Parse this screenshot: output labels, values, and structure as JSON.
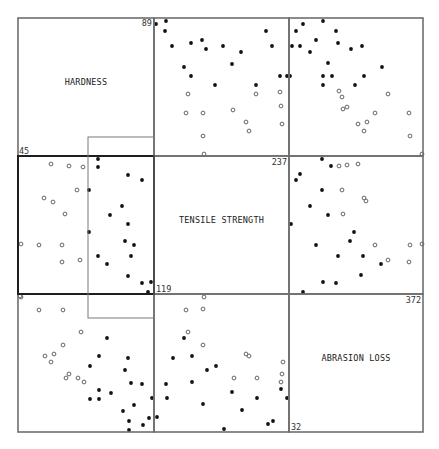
{
  "chart_data": {
    "type": "scatter",
    "subtype": "scatterplot-matrix",
    "title": "",
    "variables": [
      {
        "name": "HARDNESS",
        "min": 45,
        "max": 89
      },
      {
        "name": "TENSILE STRENGTH",
        "min": 119,
        "max": 237
      },
      {
        "name": "ABRASION LOSS",
        "min": 32,
        "max": 372
      }
    ],
    "diagonal_labels": [
      "HARDNESS",
      "TENSILE STRENGTH",
      "ABRASION LOSS"
    ],
    "range_labels": {
      "hardness_max": "89",
      "hardness_min": "45",
      "tensile_max": "237",
      "tensile_min": "119",
      "abrasion_max": "372",
      "abrasion_min": "32"
    },
    "legend": {
      "filled": "points inside brush (tensile strength in brushed range)",
      "open": "points outside brush"
    },
    "brush": {
      "panel": "row2-col1",
      "note": "rectangle brush spanning the right half of the TENSILE STRENGTH vs HARDNESS panel"
    },
    "selected_panel": "row2-col1",
    "grid": {
      "rows": 3,
      "cols": 3
    },
    "panels": [
      {
        "id": "r1c2",
        "row": 1,
        "col": 2,
        "x_var": "TENSILE STRENGTH",
        "y_var": "HARDNESS",
        "filled": [
          [
            2,
            6
          ],
          [
            12,
            3
          ],
          [
            11,
            13
          ],
          [
            18,
            28
          ],
          [
            37,
            25
          ],
          [
            48,
            22
          ],
          [
            52,
            31
          ],
          [
            69,
            28
          ],
          [
            87,
            34
          ],
          [
            112,
            13
          ],
          [
            118,
            28
          ],
          [
            30,
            49
          ],
          [
            37,
            58
          ],
          [
            78,
            46
          ],
          [
            61,
            67
          ],
          [
            102,
            67
          ],
          [
            126,
            58
          ],
          [
            133,
            58
          ]
        ],
        "open": [
          [
            34,
            76
          ],
          [
            32,
            95
          ],
          [
            49,
            95
          ],
          [
            79,
            92
          ],
          [
            102,
            76
          ],
          [
            126,
            74
          ],
          [
            127,
            88
          ],
          [
            128,
            106
          ],
          [
            92,
            104
          ],
          [
            95,
            113
          ],
          [
            49,
            118
          ],
          [
            50,
            136
          ]
        ]
      },
      {
        "id": "r1c3",
        "row": 1,
        "col": 3,
        "x_var": "ABRASION LOSS",
        "y_var": "HARDNESS",
        "filled": [
          [
            7,
            13
          ],
          [
            14,
            6
          ],
          [
            34,
            3
          ],
          [
            3,
            28
          ],
          [
            11,
            28
          ],
          [
            27,
            22
          ],
          [
            47,
            13
          ],
          [
            49,
            25
          ],
          [
            21,
            34
          ],
          [
            62,
            31
          ],
          [
            73,
            28
          ],
          [
            39,
            45
          ],
          [
            34,
            58
          ],
          [
            43,
            58
          ],
          [
            34,
            67
          ],
          [
            75,
            58
          ],
          [
            66,
            67
          ],
          [
            93,
            49
          ],
          [
            1,
            58
          ]
        ],
        "open": [
          [
            50,
            73
          ],
          [
            53,
            79
          ],
          [
            54,
            91
          ],
          [
            58,
            89
          ],
          [
            69,
            106
          ],
          [
            78,
            104
          ],
          [
            75,
            113
          ],
          [
            86,
            95
          ],
          [
            99,
            76
          ],
          [
            120,
            95
          ],
          [
            121,
            118
          ],
          [
            133,
            136
          ]
        ]
      },
      {
        "id": "r2c1",
        "row": 2,
        "col": 1,
        "x_var": "HARDNESS",
        "y_var": "TENSILE STRENGTH",
        "filled": [
          [
            80,
            3
          ],
          [
            80,
            11
          ],
          [
            110,
            19
          ],
          [
            124,
            24
          ],
          [
            71,
            34
          ],
          [
            104,
            50
          ],
          [
            92,
            59
          ],
          [
            110,
            68
          ],
          [
            71,
            76
          ],
          [
            107,
            85
          ],
          [
            116,
            89
          ],
          [
            80,
            100
          ],
          [
            113,
            100
          ],
          [
            89,
            108
          ],
          [
            110,
            120
          ],
          [
            124,
            127
          ],
          [
            133,
            126
          ],
          [
            130,
            136
          ]
        ],
        "open": [
          [
            33,
            8
          ],
          [
            51,
            10
          ],
          [
            65,
            11
          ],
          [
            59,
            34
          ],
          [
            26,
            42
          ],
          [
            35,
            46
          ],
          [
            47,
            58
          ],
          [
            3,
            88
          ],
          [
            21,
            89
          ],
          [
            44,
            89
          ],
          [
            44,
            106
          ],
          [
            62,
            104
          ],
          [
            3,
            141
          ]
        ]
      },
      {
        "id": "r2c3",
        "row": 2,
        "col": 3,
        "x_var": "ABRASION LOSS",
        "y_var": "TENSILE STRENGTH",
        "filled": [
          [
            33,
            3
          ],
          [
            42,
            10
          ],
          [
            11,
            18
          ],
          [
            7,
            24
          ],
          [
            33,
            34
          ],
          [
            21,
            50
          ],
          [
            39,
            59
          ],
          [
            2,
            68
          ],
          [
            65,
            76
          ],
          [
            61,
            85
          ],
          [
            27,
            89
          ],
          [
            49,
            100
          ],
          [
            74,
            100
          ],
          [
            92,
            108
          ],
          [
            72,
            119
          ],
          [
            34,
            126
          ],
          [
            47,
            127
          ],
          [
            14,
            136
          ]
        ],
        "open": [
          [
            50,
            10
          ],
          [
            58,
            9
          ],
          [
            69,
            8
          ],
          [
            53,
            34
          ],
          [
            75,
            42
          ],
          [
            77,
            45
          ],
          [
            54,
            58
          ],
          [
            86,
            89
          ],
          [
            121,
            89
          ],
          [
            133,
            88
          ],
          [
            99,
            104
          ],
          [
            120,
            106
          ]
        ]
      },
      {
        "id": "r3c1",
        "row": 3,
        "col": 1,
        "x_var": "HARDNESS",
        "y_var": "ABRASION LOSS",
        "filled": [
          [
            89,
            44
          ],
          [
            81,
            62
          ],
          [
            110,
            64
          ],
          [
            72,
            72
          ],
          [
            107,
            76
          ],
          [
            113,
            89
          ],
          [
            124,
            90
          ],
          [
            81,
            96
          ],
          [
            93,
            99
          ],
          [
            72,
            105
          ],
          [
            81,
            105
          ],
          [
            134,
            104
          ],
          [
            116,
            111
          ],
          [
            105,
            117
          ],
          [
            131,
            124
          ],
          [
            111,
            127
          ],
          [
            125,
            131
          ],
          [
            111,
            136
          ]
        ],
        "open": [
          [
            2,
            2
          ],
          [
            21,
            16
          ],
          [
            45,
            16
          ],
          [
            63,
            38
          ],
          [
            45,
            51
          ],
          [
            27,
            62
          ],
          [
            36,
            60
          ],
          [
            33,
            68
          ],
          [
            51,
            80
          ],
          [
            48,
            84
          ],
          [
            60,
            84
          ],
          [
            66,
            88
          ]
        ]
      },
      {
        "id": "r3c2",
        "row": 3,
        "col": 2,
        "x_var": "TENSILE STRENGTH",
        "y_var": "ABRASION LOSS",
        "filled": [
          [
            30,
            44
          ],
          [
            19,
            64
          ],
          [
            38,
            62
          ],
          [
            62,
            72
          ],
          [
            53,
            76
          ],
          [
            12,
            90
          ],
          [
            38,
            88
          ],
          [
            13,
            104
          ],
          [
            78,
            98
          ],
          [
            127,
            95
          ],
          [
            103,
            104
          ],
          [
            133,
            104
          ],
          [
            49,
            110
          ],
          [
            88,
            116
          ],
          [
            3,
            123
          ],
          [
            114,
            130
          ],
          [
            119,
            127
          ],
          [
            70,
            135
          ]
        ],
        "open": [
          [
            50,
            3
          ],
          [
            32,
            16
          ],
          [
            49,
            15
          ],
          [
            34,
            38
          ],
          [
            49,
            51
          ],
          [
            92,
            60
          ],
          [
            95,
            62
          ],
          [
            129,
            68
          ],
          [
            128,
            80
          ],
          [
            127,
            88
          ],
          [
            80,
            84
          ],
          [
            103,
            84
          ]
        ]
      }
    ]
  },
  "layout": {
    "col_edges": [
      18,
      154,
      289,
      423
    ],
    "row_edges": [
      18,
      156,
      294,
      432
    ],
    "brush_rect": {
      "x": 88,
      "y": 137,
      "w": 66,
      "h": 181
    }
  }
}
